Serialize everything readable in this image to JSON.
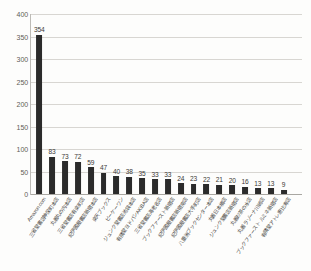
{
  "chart_data": {
    "type": "bar",
    "title": "",
    "xlabel": "",
    "ylabel": "",
    "ylim": [
      0,
      400
    ],
    "ytick_step": 50,
    "grid": true,
    "legend": "none",
    "bar_color": "#2b2b2b",
    "yticks": [
      "0",
      "50",
      "100",
      "150",
      "200",
      "250",
      "300",
      "350",
      "400"
    ],
    "categories": [
      "Amazon.com",
      "三省堂書店神保町本店",
      "丸善丸の内本店",
      "三省堂書店有楽町店",
      "紀伊國屋書店新宿本店",
      "楽天ブックス",
      "ビーケーワン",
      "ジュンク堂書店池袋本店",
      "有隣堂ヨドバシAKIBA店",
      "三省堂書店海老名店",
      "ブックファースト新宿店",
      "紀伊國屋書店新宿南店",
      "紀伊國屋書店大手町店",
      "八重洲ブックセンター本店",
      "丸善日本橋店",
      "ジュンク堂書店新宿店",
      "丸善お茶の水店",
      "丸善ラゾーナ川崎店",
      "ブックファースト ルミネ新宿店",
      "有隣堂アトレ恵比寿店"
    ],
    "values": [
      354,
      83,
      73,
      72,
      59,
      47,
      40,
      38,
      35,
      33,
      33,
      24,
      23,
      22,
      21,
      20,
      16,
      13,
      13,
      9
    ]
  }
}
